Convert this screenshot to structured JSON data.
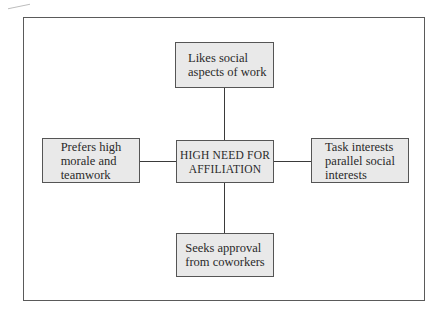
{
  "diagram": {
    "center": {
      "label": "HIGH NEED FOR\nAFFILIATION"
    },
    "top": {
      "label": "Likes social\naspects of work"
    },
    "left": {
      "label": "Prefers high\nmorale and\nteamwork"
    },
    "right": {
      "label": "Task interests\nparallel social\ninterests"
    },
    "bottom": {
      "label": "Seeks approval\nfrom coworkers"
    },
    "colors": {
      "box_fill": "#e9e9e9",
      "border": "#555555",
      "connector": "#3a3a3a"
    }
  }
}
